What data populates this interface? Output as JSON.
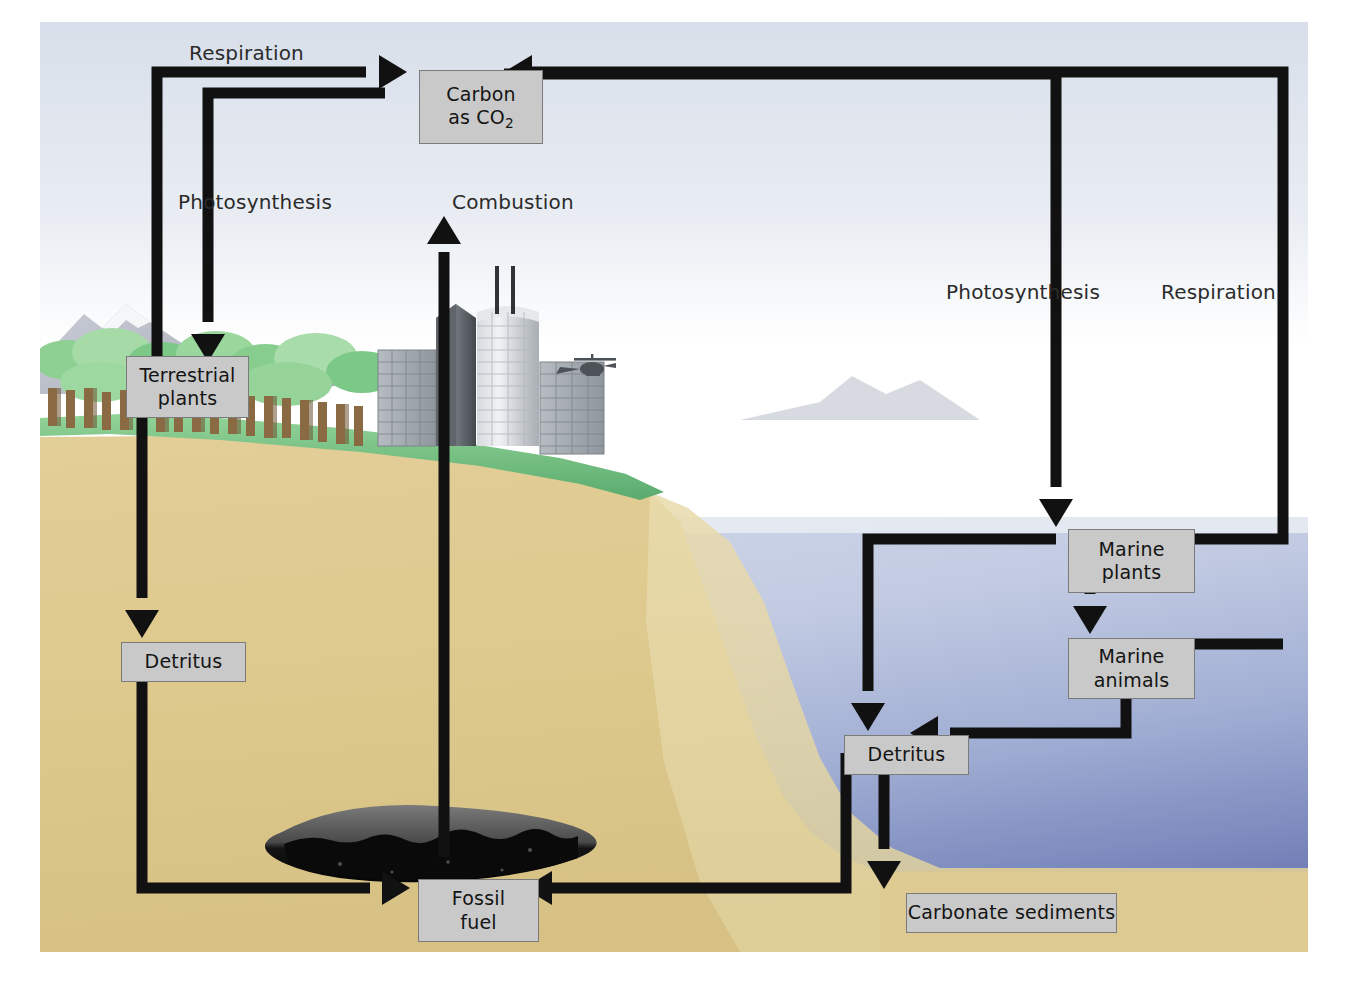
{
  "diagram": {
    "frame": {
      "x": 40,
      "y": 22,
      "width": 1268,
      "height": 930
    }
  },
  "colors": {
    "box_fill": "#c9c9c9",
    "box_border": "#7b7b7b",
    "arrow": "#111111",
    "sky": "#dfe4ec",
    "sky_low": "#ffffff",
    "ocean_top": "#c3ccdf",
    "ocean_deep": "#7b8cc0",
    "soil": "#ddc98e",
    "soil_shelf": "#e6d6a3",
    "grass": "#86c98e",
    "grass_dark": "#5aab6e",
    "coal_top": "#6e6e6e",
    "coal_bottom": "#111111",
    "mountain": "#b9bdc8",
    "tree": "#8fce92",
    "trunk": "#8a6a42",
    "building": "#9aa0a6",
    "text": "#1a1a1a"
  },
  "nodes": [
    {
      "id": "carbon-co2",
      "label_line1": "Carbon",
      "label_line2": "as CO",
      "subscript": "2",
      "x": 379,
      "y": 48,
      "w": 124,
      "h": 74
    },
    {
      "id": "terrestrial-plants",
      "label_line1": "Terrestrial",
      "label_line2": "plants",
      "x": 86,
      "y": 334,
      "w": 123,
      "h": 62
    },
    {
      "id": "detritus-land",
      "label_line1": "Detritus",
      "x": 81,
      "y": 620,
      "w": 125,
      "h": 40
    },
    {
      "id": "fossil-fuel",
      "label_line1": "Fossil",
      "label_line2": "fuel",
      "x": 378,
      "y": 857,
      "w": 121,
      "h": 63
    },
    {
      "id": "marine-plants",
      "label_line1": "Marine",
      "label_line2": "plants",
      "x": 1028,
      "y": 507,
      "w": 127,
      "h": 64
    },
    {
      "id": "marine-animals",
      "label_line1": "Marine",
      "label_line2": "animals",
      "x": 1028,
      "y": 616,
      "w": 127,
      "h": 61
    },
    {
      "id": "detritus-ocean",
      "label_line1": "Detritus",
      "x": 804,
      "y": 713,
      "w": 125,
      "h": 40
    },
    {
      "id": "carbonate-sediments",
      "label_line1": "Carbonate sediments",
      "x": 866,
      "y": 871,
      "w": 211,
      "h": 40
    }
  ],
  "flow_labels": [
    {
      "id": "respiration-land",
      "text": "Respiration",
      "x": 189,
      "y": 41
    },
    {
      "id": "photosynthesis-land",
      "text": "Photosynthesis",
      "x": 178,
      "y": 190
    },
    {
      "id": "combustion",
      "text": "Combustion",
      "x": 452,
      "y": 190
    },
    {
      "id": "photosynthesis-sea",
      "text": "Photosynthesis",
      "x": 946,
      "y": 280
    },
    {
      "id": "respiration-sea",
      "text": "Respiration",
      "x": 1161,
      "y": 280
    }
  ],
  "flows": [
    {
      "id": "flow-terrestrial-plants-to-carbon",
      "from": "terrestrial-plants",
      "to": "carbon-co2",
      "label": "Respiration"
    },
    {
      "id": "flow-carbon-to-terrestrial-plants",
      "from": "carbon-co2",
      "to": "terrestrial-plants",
      "label": "Photosynthesis"
    },
    {
      "id": "flow-fossil-fuel-to-carbon",
      "from": "fossil-fuel",
      "to": "carbon-co2",
      "label": "Combustion"
    },
    {
      "id": "flow-carbon-to-marine-plants",
      "from": "carbon-co2",
      "to": "marine-plants",
      "label": "Photosynthesis"
    },
    {
      "id": "flow-marine-plants-to-carbon",
      "from": "marine-plants",
      "to": "carbon-co2",
      "label": "Respiration"
    },
    {
      "id": "flow-marine-animals-to-carbon",
      "from": "marine-animals",
      "to": "carbon-co2",
      "label": "Respiration"
    },
    {
      "id": "flow-terrestrial-plants-to-detritus",
      "from": "terrestrial-plants",
      "to": "detritus-land",
      "label": ""
    },
    {
      "id": "flow-detritus-land-to-fossil-fuel",
      "from": "detritus-land",
      "to": "fossil-fuel",
      "label": ""
    },
    {
      "id": "flow-marine-plants-to-marine-animals",
      "from": "marine-plants",
      "to": "marine-animals",
      "label": ""
    },
    {
      "id": "flow-marine-plants-to-detritus",
      "from": "marine-plants",
      "to": "detritus-ocean",
      "label": ""
    },
    {
      "id": "flow-marine-animals-to-detritus",
      "from": "marine-animals",
      "to": "detritus-ocean",
      "label": ""
    },
    {
      "id": "flow-detritus-ocean-to-fossil-fuel",
      "from": "detritus-ocean",
      "to": "fossil-fuel",
      "label": ""
    },
    {
      "id": "flow-detritus-ocean-to-carbonate",
      "from": "detritus-ocean",
      "to": "carbonate-sediments",
      "label": ""
    }
  ],
  "scenery": {
    "mountain": "snow-capped-mountain",
    "forest": "temperate-forest",
    "city": "city-skyline-four-buildings",
    "aircraft": "helicopter",
    "deposit": "coal-oil-lens"
  }
}
